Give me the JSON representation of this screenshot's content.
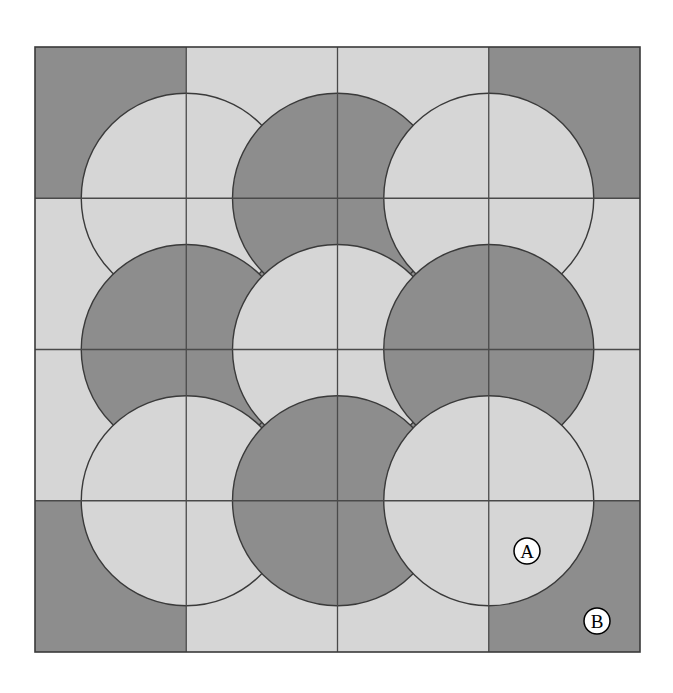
{
  "figure": {
    "type": "geometric-diagram",
    "canvas": {
      "width": 673,
      "height": 693,
      "background": "#ffffff"
    },
    "grid": {
      "x0": 35,
      "y0": 47,
      "cols": 4,
      "rows": 4,
      "cell": 151.25,
      "line_color": "#4a4a4a",
      "line_width": 1.3,
      "border_color": "#3a3a3a",
      "border_width": 1.6
    },
    "palette": {
      "light": "#d6d6d6",
      "dark": "#8d8d8d",
      "outline": "#3a3a3a",
      "label_fill": "#ffffff",
      "label_stroke": "#000000",
      "label_text": "#000000"
    },
    "circle_radius": 105
  },
  "tiles": [
    {
      "row": 0,
      "col": 0,
      "fill": "dark",
      "name": "tile-r0c0"
    },
    {
      "row": 0,
      "col": 1,
      "fill": "light",
      "name": "tile-r0c1"
    },
    {
      "row": 0,
      "col": 2,
      "fill": "light",
      "name": "tile-r0c2"
    },
    {
      "row": 0,
      "col": 3,
      "fill": "dark",
      "name": "tile-r0c3"
    },
    {
      "row": 1,
      "col": 0,
      "fill": "light",
      "name": "tile-r1c0"
    },
    {
      "row": 1,
      "col": 1,
      "fill": "dark",
      "name": "tile-r1c1"
    },
    {
      "row": 1,
      "col": 2,
      "fill": "dark",
      "name": "tile-r1c2"
    },
    {
      "row": 1,
      "col": 3,
      "fill": "light",
      "name": "tile-r1c3"
    },
    {
      "row": 2,
      "col": 0,
      "fill": "light",
      "name": "tile-r2c0"
    },
    {
      "row": 2,
      "col": 1,
      "fill": "dark",
      "name": "tile-r2c1"
    },
    {
      "row": 2,
      "col": 2,
      "fill": "dark",
      "name": "tile-r2c2"
    },
    {
      "row": 2,
      "col": 3,
      "fill": "light",
      "name": "tile-r2c3"
    },
    {
      "row": 3,
      "col": 0,
      "fill": "dark",
      "name": "tile-r3c0"
    },
    {
      "row": 3,
      "col": 1,
      "fill": "light",
      "name": "tile-r3c1"
    },
    {
      "row": 3,
      "col": 2,
      "fill": "light",
      "name": "tile-r3c2"
    },
    {
      "row": 3,
      "col": 3,
      "fill": "dark",
      "name": "tile-r3c3"
    }
  ],
  "discs": [
    {
      "name": "disc-corner-top-left",
      "gx": 1,
      "gy": 1,
      "fill": "light",
      "kind": "quarter"
    },
    {
      "name": "disc-edge-top",
      "gx": 2,
      "gy": 1,
      "fill": "dark",
      "kind": "half"
    },
    {
      "name": "disc-corner-top-right",
      "gx": 3,
      "gy": 1,
      "fill": "light",
      "kind": "quarter"
    },
    {
      "name": "disc-edge-left",
      "gx": 1,
      "gy": 2,
      "fill": "dark",
      "kind": "half"
    },
    {
      "name": "disc-centre",
      "gx": 2,
      "gy": 2,
      "fill": "light",
      "kind": "full"
    },
    {
      "name": "disc-edge-right",
      "gx": 3,
      "gy": 2,
      "fill": "dark",
      "kind": "half"
    },
    {
      "name": "disc-corner-bottom-left",
      "gx": 1,
      "gy": 3,
      "fill": "light",
      "kind": "quarter"
    },
    {
      "name": "disc-edge-bottom",
      "gx": 2,
      "gy": 3,
      "fill": "dark",
      "kind": "half"
    },
    {
      "name": "disc-corner-bottom-right",
      "gx": 3,
      "gy": 3,
      "fill": "light",
      "kind": "quarter"
    }
  ],
  "labels": [
    {
      "id": "A",
      "text": "A",
      "cx": 527,
      "cy": 551,
      "r": 13,
      "region": "light quarter disc inside bottom-right corner tile"
    },
    {
      "id": "B",
      "text": "B",
      "cx": 597,
      "cy": 621,
      "r": 13,
      "region": "dark corner of bottom-right tile outside the quarter disc"
    }
  ]
}
